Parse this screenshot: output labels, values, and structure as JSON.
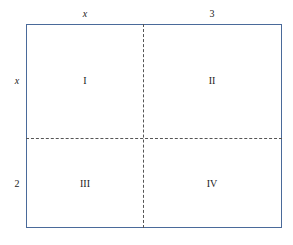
{
  "diagram": {
    "top_labels": [
      "x",
      "3"
    ],
    "side_labels": [
      "x",
      "2"
    ],
    "regions": [
      "I",
      "II",
      "III",
      "IV"
    ],
    "colors": {
      "border": "#4a6a9a",
      "dash": "#555555"
    }
  }
}
